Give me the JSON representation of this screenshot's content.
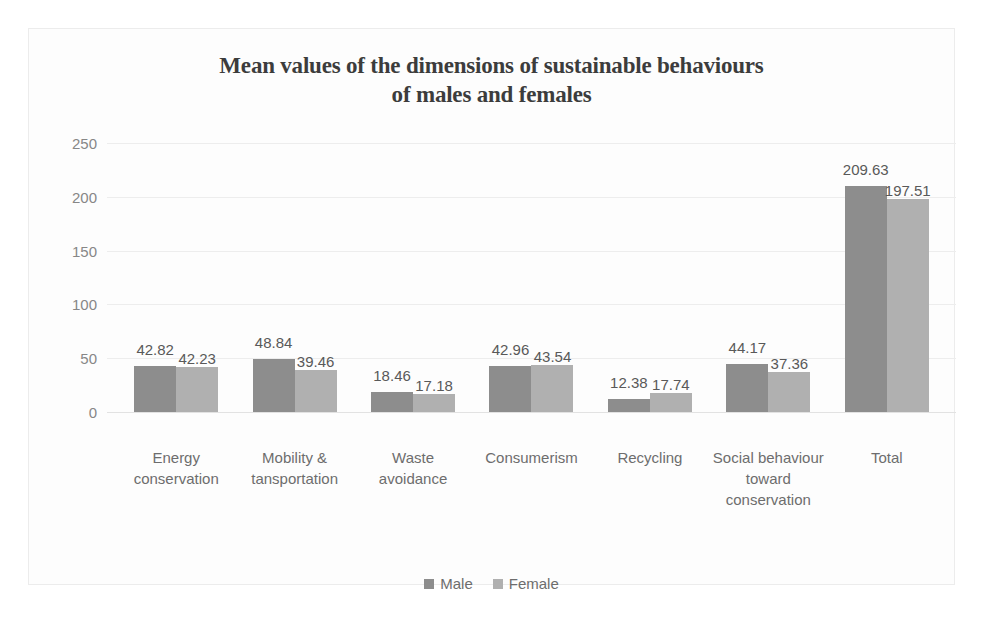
{
  "chart_data": {
    "type": "bar",
    "title": "Mean values of the dimensions of sustainable behaviours of males and females",
    "title_line1": "Mean values of the dimensions of sustainable behaviours",
    "title_line2": "of males and females",
    "xlabel": "",
    "ylabel": "",
    "ylim": [
      0,
      250
    ],
    "yticks": [
      "250",
      "200",
      "150",
      "100",
      "50",
      "0"
    ],
    "grid": true,
    "legend_position": "bottom",
    "categories": [
      "Energy conservation",
      "Mobility & tansportation",
      "Waste avoidance",
      "Consumerism",
      "Recycling",
      "Social behaviour toward conservation",
      "Total"
    ],
    "series": [
      {
        "name": "Male",
        "color": "#8d8d8d",
        "values": [
          42.82,
          48.84,
          18.46,
          42.96,
          12.38,
          44.17,
          209.63
        ],
        "labels": [
          "42.82",
          "48.84",
          "18.46",
          "42.96",
          "12.38",
          "44.17",
          "209.63"
        ]
      },
      {
        "name": "Female",
        "color": "#b0b0b0",
        "values": [
          42.23,
          39.46,
          17.18,
          43.54,
          17.74,
          37.36,
          197.51
        ],
        "labels": [
          "42.23",
          "39.46",
          "17.18",
          "43.54",
          "17.74",
          "37.36",
          "197.51"
        ]
      }
    ]
  },
  "legend": [
    {
      "label": "Male",
      "color": "#8d8d8d"
    },
    {
      "label": "Female",
      "color": "#b0b0b0"
    }
  ]
}
